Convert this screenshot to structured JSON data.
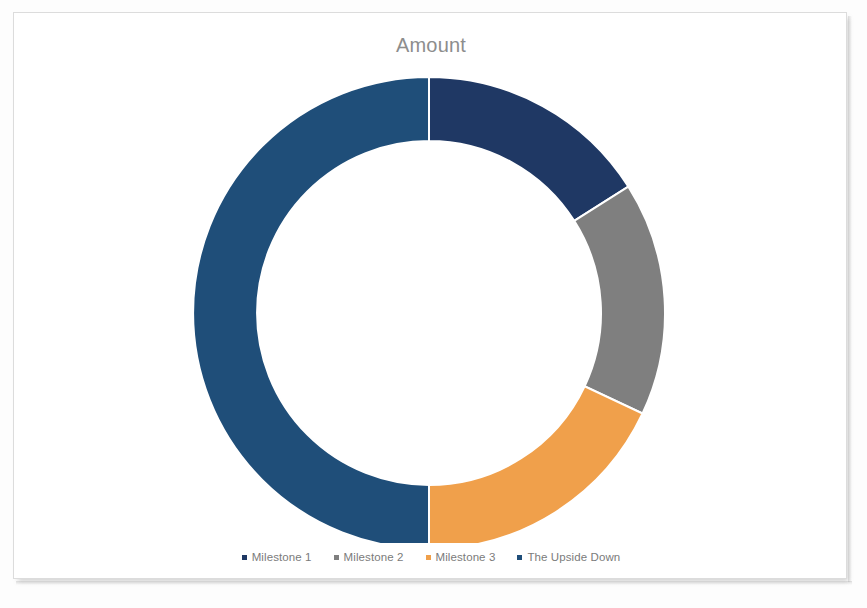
{
  "chart": {
    "title": "Amount",
    "title_color": "#8d8d8d",
    "background": "#ffffff",
    "border_color": "#dcdcdc"
  },
  "legend": {
    "position": "bottom",
    "items": [
      {
        "label": "Milestone 1",
        "color": "#1F3864"
      },
      {
        "label": "Milestone 2",
        "color": "#7F7F7F"
      },
      {
        "label": "Milestone 3",
        "color": "#F0A04B"
      },
      {
        "label": "The Upside Down",
        "color": "#1F4E79"
      }
    ]
  },
  "chart_data": {
    "type": "pie",
    "variant": "doughnut",
    "title": "Amount",
    "xlabel": "",
    "ylabel": "",
    "legend_position": "bottom",
    "grid": false,
    "hole_ratio": 0.73,
    "start_angle_deg": 0,
    "direction": "clockwise",
    "categories": [
      "Milestone 1",
      "Milestone 2",
      "Milestone 3",
      "The Upside Down"
    ],
    "values": [
      16,
      16,
      18,
      50
    ],
    "percentages": [
      16,
      16,
      18,
      50
    ],
    "angles_deg": [
      57.6,
      57.6,
      64.8,
      180.0
    ],
    "colors": [
      "#1F3864",
      "#7F7F7F",
      "#F0A04B",
      "#1F4E79"
    ],
    "slices": [
      {
        "name": "Milestone 1",
        "value": 16,
        "percent": 16,
        "start_deg": 0.0,
        "end_deg": 57.6,
        "color": "#1F3864"
      },
      {
        "name": "Milestone 2",
        "value": 16,
        "percent": 16,
        "start_deg": 57.6,
        "end_deg": 115.2,
        "color": "#7F7F7F"
      },
      {
        "name": "Milestone 3",
        "value": 18,
        "percent": 18,
        "start_deg": 115.2,
        "end_deg": 180.0,
        "color": "#F0A04B"
      },
      {
        "name": "The Upside Down",
        "value": 50,
        "percent": 50,
        "start_deg": 180.0,
        "end_deg": 360.0,
        "color": "#1F4E79"
      }
    ]
  }
}
